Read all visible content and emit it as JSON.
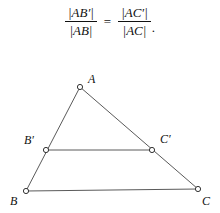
{
  "figure": {
    "background_color": "#ffffff",
    "ink_color": "#111111",
    "line_color": "#5a5a5a",
    "formula": {
      "left_fraction": {
        "numerator": "|AB′|",
        "denominator": "|AB|"
      },
      "relation": "=",
      "right_fraction": {
        "numerator": "|AC′|",
        "denominator": "|AC|"
      },
      "trailing_punctuation": "."
    },
    "diagram": {
      "type": "geometry",
      "description": "triangle-with-parallel-segment",
      "points": [
        {
          "id": "A",
          "label": "A",
          "x": 80,
          "y": 32,
          "label_dx": 8,
          "label_dy": -14
        },
        {
          "id": "Bp",
          "label": "B′",
          "x": 46,
          "y": 95,
          "label_dx": -22,
          "label_dy": -16
        },
        {
          "id": "Cp",
          "label": "C′",
          "x": 152,
          "y": 95,
          "label_dx": 8,
          "label_dy": -17
        },
        {
          "id": "B",
          "label": "B",
          "x": 26,
          "y": 136,
          "label_dx": -16,
          "label_dy": 4
        },
        {
          "id": "C",
          "label": "C",
          "x": 198,
          "y": 134,
          "label_dx": 4,
          "label_dy": 6
        }
      ],
      "segments": [
        {
          "id": "AB",
          "from": "A",
          "to": "B"
        },
        {
          "id": "AC",
          "from": "A",
          "to": "C"
        },
        {
          "id": "BC",
          "from": "B",
          "to": "C"
        },
        {
          "id": "BpCp",
          "from": "Bp",
          "to": "Cp"
        }
      ],
      "marker": {
        "shape": "open-circle",
        "radius": 2.6,
        "fill": "#ffffff",
        "stroke": "#333333"
      }
    }
  }
}
